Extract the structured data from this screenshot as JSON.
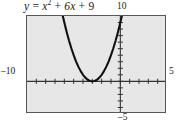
{
  "figure": {
    "title_equation": {
      "full_text": "y = x² + 6x + 9",
      "lhs": "y",
      "equals": "=",
      "term1_base": "x",
      "term1_exp": "2",
      "plus1": "+",
      "term2": "6x",
      "plus2": "+",
      "term3": "9"
    },
    "axis_labels": {
      "x_min": "–10",
      "x_max": "5",
      "y_max": "10",
      "y_min": "–5"
    },
    "colors": {
      "plot_background": "#e7e7e7",
      "frame_border": "#58585a",
      "curve": "#111111",
      "axis": "#333333",
      "text": "#1a1a1a",
      "page_background": "#ffffff"
    }
  },
  "chart_data": {
    "type": "line",
    "xlabel": "",
    "ylabel": "",
    "xlim": [
      -10,
      5
    ],
    "ylim": [
      -5,
      10
    ],
    "grid": false,
    "legend": null,
    "x_ticks": [
      -10,
      -9,
      -8,
      -7,
      -6,
      -5,
      -4,
      -3,
      -2,
      -1,
      0,
      1,
      2,
      3,
      4,
      5
    ],
    "y_ticks": [
      -5,
      -4,
      -3,
      -2,
      -1,
      0,
      1,
      2,
      3,
      4,
      5,
      6,
      7,
      8,
      9,
      10
    ],
    "tick_labels_shown": [
      "–10",
      "5",
      "10",
      "–5"
    ],
    "series": [
      {
        "name": "y = x^2 + 6x + 9",
        "equation": "y = x^2 + 6x + 9",
        "vertex": [
          -3,
          0
        ],
        "roots": [
          -3
        ],
        "x": [
          -6.2,
          -6.0,
          -5.75,
          -5.5,
          -5.25,
          -5.0,
          -4.75,
          -4.5,
          -4.25,
          -4.0,
          -3.75,
          -3.5,
          -3.25,
          -3.0,
          -2.75,
          -2.5,
          -2.25,
          -2.0,
          -1.75,
          -1.5,
          -1.25,
          -1.0,
          -0.75,
          -0.5,
          -0.25,
          0.0,
          0.2
        ],
        "y": [
          10.24,
          9.0,
          7.5625,
          6.25,
          5.0625,
          4.0,
          3.0625,
          2.25,
          1.5625,
          1.0,
          0.5625,
          0.25,
          0.0625,
          0.0,
          0.0625,
          0.25,
          0.5625,
          1.0,
          1.5625,
          2.25,
          3.0625,
          4.0,
          5.0625,
          6.25,
          7.5625,
          9.0,
          10.24
        ]
      }
    ]
  }
}
